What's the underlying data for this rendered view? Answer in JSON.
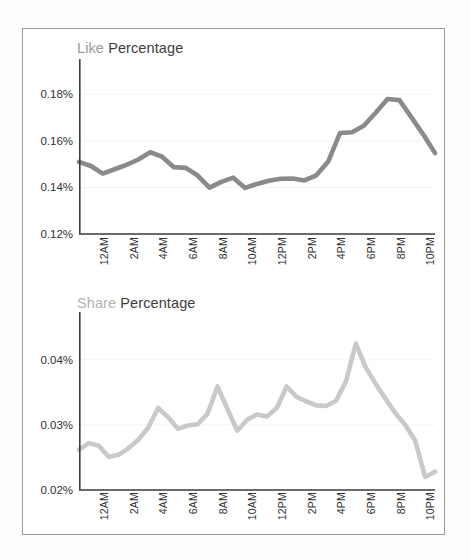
{
  "page": {
    "background": "#fdfdfd",
    "card_border_color": "#9a9a9a",
    "card_background": "#ffffff"
  },
  "charts": [
    {
      "id": "like",
      "title_metric": "Like",
      "title_suffix": " Percentage",
      "title_metric_color": "#9b9b9b",
      "title_suffix_color": "#3d3d3d"
    },
    {
      "id": "share",
      "title_metric": "Share",
      "title_suffix": " Percentage",
      "title_metric_color": "#d3d3d3",
      "title_suffix_color": "#3d3d3d"
    }
  ],
  "chart_data": [
    {
      "type": "line",
      "id": "like-percentage-chart",
      "title": "Like Percentage",
      "xlabel": "",
      "ylabel": "",
      "series": [
        {
          "name": "Like Percentage",
          "color": "#8a8a8a",
          "line_width": 4.6,
          "values": [
            0.151,
            0.1492,
            0.1459,
            0.1478,
            0.1497,
            0.152,
            0.1551,
            0.1532,
            0.1487,
            0.1484,
            0.1451,
            0.1399,
            0.1424,
            0.1442,
            0.1398,
            0.1415,
            0.1429,
            0.1437,
            0.1438,
            0.143,
            0.1452,
            0.1511,
            0.1634,
            0.1637,
            0.1665,
            0.1721,
            0.178,
            0.1775,
            0.1702,
            0.1628,
            0.1548
          ]
        }
      ],
      "x": [
        "12AM",
        "",
        "2AM",
        "",
        "4AM",
        "",
        "6AM",
        "",
        "8AM",
        "",
        "10AM",
        "",
        "12PM",
        "",
        "2PM",
        "",
        "4PM",
        "",
        "6PM",
        "",
        "8PM",
        "",
        "10PM",
        ""
      ],
      "xtick_labels": [
        "12AM",
        "2AM",
        "4AM",
        "6AM",
        "8AM",
        "10AM",
        "12PM",
        "2PM",
        "4PM",
        "6PM",
        "8PM",
        "10PM"
      ],
      "ytick_labels": [
        "0.18%",
        "0.16%",
        "0.14%",
        "0.12%"
      ],
      "ytick_values": [
        0.18,
        0.16,
        0.14,
        0.12
      ],
      "ylim": [
        0.12,
        0.19
      ],
      "grid": true,
      "gridline_color": "#f4f4f4",
      "axis_color": "#3d3d3d",
      "legend": "none"
    },
    {
      "type": "line",
      "id": "share-percentage-chart",
      "title": "Share Percentage",
      "xlabel": "",
      "ylabel": "",
      "series": [
        {
          "name": "Share Percentage",
          "color": "#c9c9c9",
          "line_width": 4.6,
          "values": [
            0.0262,
            0.0272,
            0.0268,
            0.0251,
            0.0254,
            0.0264,
            0.0277,
            0.0296,
            0.0326,
            0.0312,
            0.0294,
            0.0299,
            0.0301,
            0.0317,
            0.0359,
            0.0325,
            0.0291,
            0.0308,
            0.0316,
            0.0313,
            0.0326,
            0.0359,
            0.0343,
            0.0336,
            0.033,
            0.0329,
            0.0337,
            0.0367,
            0.0425,
            0.0388,
            0.0363,
            0.034,
            0.0318,
            0.03,
            0.0276,
            0.022,
            0.0228
          ]
        }
      ],
      "xtick_labels": [
        "12AM",
        "2AM",
        "4AM",
        "6AM",
        "8AM",
        "10AM",
        "12PM",
        "2PM",
        "4PM",
        "6PM",
        "8PM",
        "10PM"
      ],
      "ytick_labels": [
        "0.04%",
        "0.03%",
        "0.02%"
      ],
      "ytick_values": [
        0.04,
        0.03,
        0.02
      ],
      "ylim": [
        0.02,
        0.0455
      ],
      "grid": true,
      "gridline_color": "#f4f4f4",
      "axis_color": "#3d3d3d",
      "legend": "none"
    }
  ]
}
